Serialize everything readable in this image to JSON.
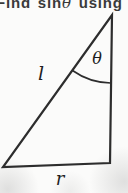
{
  "heading": {
    "text_prefix": "Find sin",
    "theta": "θ",
    "text_suffix": " using"
  },
  "diagram": {
    "type": "right-triangle",
    "labels": {
      "angle": "θ",
      "hypotenuse": "l",
      "base": "r"
    },
    "colors": {
      "line": "#2d2d2d",
      "label_text": "#1e1e1e",
      "background": "#fbfbfa"
    }
  }
}
